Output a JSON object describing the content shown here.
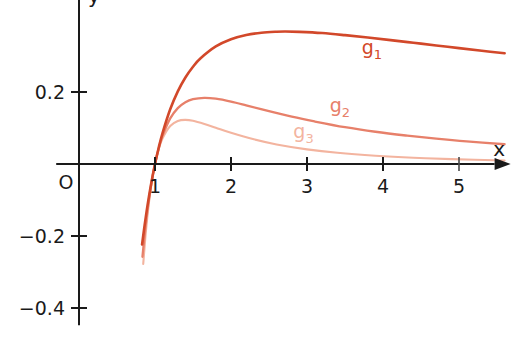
{
  "chart_data": {
    "type": "line",
    "title": "",
    "subtitle": "",
    "xlabel": "x",
    "ylabel": "y",
    "grid": false,
    "legend_position": "inline-curve-labels",
    "origin_label": "O",
    "xlim": [
      -0.3,
      5.6
    ],
    "ylim": [
      -0.47,
      0.45
    ],
    "x_ticks": [
      1,
      2,
      3,
      4,
      5
    ],
    "x_tick_labels": [
      "1",
      "2",
      "3",
      "4",
      "5"
    ],
    "y_ticks": [
      0.2,
      -0.2,
      -0.4
    ],
    "y_tick_labels": [
      "0.2",
      "-0.2",
      "-0.4"
    ],
    "series": [
      {
        "name": "g_1",
        "label_base": "g",
        "label_sub": "1",
        "color": "#d2482a",
        "formula": "ln(x)/x",
        "stroke_width": 2.6,
        "label_x": 3.72,
        "label_y": 0.305,
        "x": [
          0.83,
          0.86,
          0.9,
          0.95,
          1.0,
          1.05,
          1.1,
          1.2,
          1.3,
          1.4,
          1.5,
          1.6,
          1.8,
          2.0,
          2.2,
          2.4,
          2.6,
          2.718,
          2.9,
          3.2,
          3.5,
          3.8,
          4.1,
          4.4,
          4.7,
          5.0,
          5.3,
          5.6
        ],
        "y": [
          -0.2237,
          -0.1756,
          -0.117,
          -0.054,
          0.0,
          0.0465,
          0.0866,
          0.1519,
          0.2018,
          0.2403,
          0.2703,
          0.2938,
          0.3266,
          0.3466,
          0.3584,
          0.3647,
          0.3674,
          0.3679,
          0.3671,
          0.3637,
          0.3579,
          0.3513,
          0.3442,
          0.3368,
          0.3294,
          0.3219,
          0.3146,
          0.3075
        ]
      },
      {
        "name": "g_2",
        "label_base": "g",
        "label_sub": "2",
        "color": "#e7806a",
        "formula": "ln(x)/x^2",
        "stroke_width": 2.3,
        "label_x": 3.3,
        "label_y": 0.145,
        "x": [
          0.835,
          0.87,
          0.9,
          0.95,
          1.0,
          1.05,
          1.1,
          1.2,
          1.3,
          1.4,
          1.5,
          1.649,
          1.8,
          2.0,
          2.2,
          2.5,
          2.8,
          3.1,
          3.5,
          3.9,
          4.3,
          4.7,
          5.1,
          5.6
        ],
        "y": [
          -0.2576,
          -0.1842,
          -0.13,
          -0.0568,
          0.0,
          0.0442,
          0.0788,
          0.1267,
          0.1553,
          0.1716,
          0.1802,
          0.1839,
          0.1814,
          0.1733,
          0.1629,
          0.1466,
          0.1313,
          0.1181,
          0.1023,
          0.0896,
          0.0792,
          0.0702,
          0.0626,
          0.0549
        ]
      },
      {
        "name": "g_3",
        "label_base": "g",
        "label_sub": "3",
        "color": "#f3b49f",
        "formula": "ln(x)/x^3",
        "stroke_width": 2.1,
        "label_x": 2.82,
        "label_y": 0.072,
        "x": [
          0.845,
          0.88,
          0.92,
          0.96,
          1.0,
          1.05,
          1.1,
          1.2,
          1.3,
          1.396,
          1.5,
          1.65,
          1.8,
          2.0,
          2.3,
          2.6,
          3.0,
          3.4,
          3.9,
          4.4,
          4.9,
          5.6
        ],
        "y": [
          -0.2777,
          -0.1878,
          -0.1071,
          -0.0461,
          0.0,
          0.0421,
          0.0716,
          0.1055,
          0.1195,
          0.1226,
          0.1201,
          0.1113,
          0.1008,
          0.0866,
          0.0685,
          0.0544,
          0.0407,
          0.0311,
          0.0229,
          0.0172,
          0.0135,
          0.0098
        ]
      }
    ]
  },
  "axes": {
    "x_axis_name": "x",
    "y_axis_name": "y",
    "origin": "O"
  }
}
